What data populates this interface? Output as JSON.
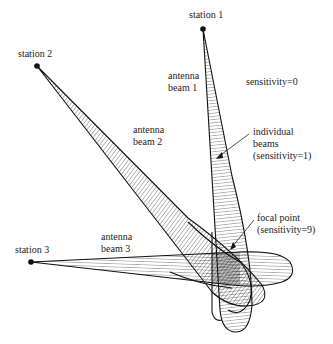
{
  "diagram": {
    "stations": [
      {
        "label": "station 1",
        "x": 203,
        "y": 29
      },
      {
        "label": "station 2",
        "x": 37,
        "y": 66
      },
      {
        "label": "station 3",
        "x": 31,
        "y": 262
      }
    ],
    "beams": [
      {
        "label_line1": "antenna",
        "label_line2": "beam 1"
      },
      {
        "label_line1": "antenna",
        "label_line2": "beam 2"
      },
      {
        "label_line1": "antenna",
        "label_line2": "beam 3"
      }
    ],
    "annotations": {
      "background": "sensitivity=0",
      "individual_line1": "individual",
      "individual_line2": "beams",
      "individual_line3": "(sensitivity=1)",
      "focal_line1": "focal point",
      "focal_line2": "(sensitivity=9)"
    },
    "colors": {
      "ink": "#111111",
      "background": "#ffffff"
    }
  }
}
